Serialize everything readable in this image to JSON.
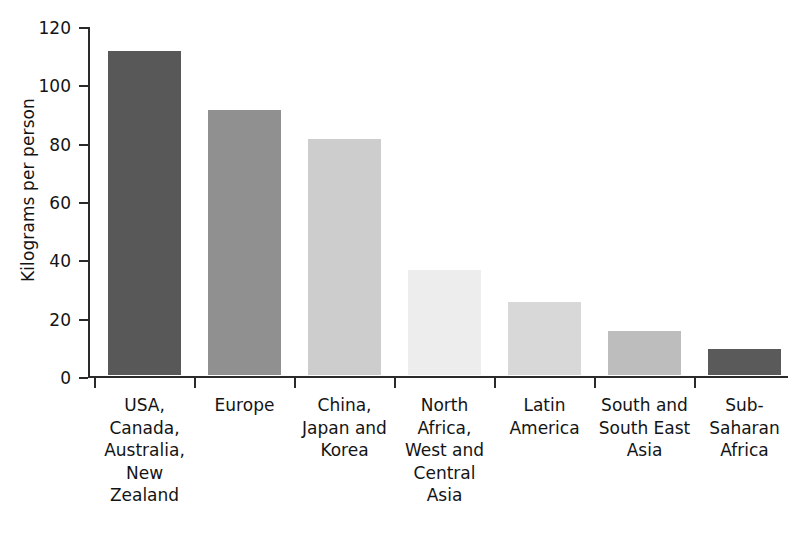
{
  "chart_data": {
    "type": "bar",
    "title": "",
    "xlabel": "",
    "ylabel": "Kilograms per person",
    "ylim": [
      0,
      120
    ],
    "ytick_labels": [
      "120",
      "100",
      "80",
      "60",
      "40",
      "20",
      "0"
    ],
    "yticks": [
      120,
      100,
      80,
      60,
      40,
      20,
      0
    ],
    "grid": false,
    "legend": "none",
    "categories": [
      "USA, Canada, Australia, New Zealand",
      "Europe",
      "China, Japan and Korea",
      "North Africa, West and Central Asia",
      "Latin America",
      "South and South East Asia",
      "Sub-Saharan Africa"
    ],
    "category_lines": [
      [
        "USA,",
        "Canada,",
        "Australia,",
        "New",
        "Zealand"
      ],
      [
        "Europe"
      ],
      [
        "China,",
        "Japan and",
        "Korea"
      ],
      [
        "North",
        "Africa,",
        "West and",
        "Central",
        "Asia"
      ],
      [
        "Latin",
        "America"
      ],
      [
        "South and",
        "South East",
        "Asia"
      ],
      [
        "Sub-",
        "Saharan",
        "Africa"
      ]
    ],
    "values": [
      111,
      91,
      81,
      36,
      25,
      15,
      9
    ],
    "bar_colors": [
      "#585858",
      "#909090",
      "#cdcdcd",
      "#ededed",
      "#d8d8d8",
      "#bdbdbd",
      "#5a5a5a"
    ]
  },
  "style": {
    "axis_color": "#2a2a2a",
    "text_color": "#141414",
    "background": "#ffffff"
  }
}
